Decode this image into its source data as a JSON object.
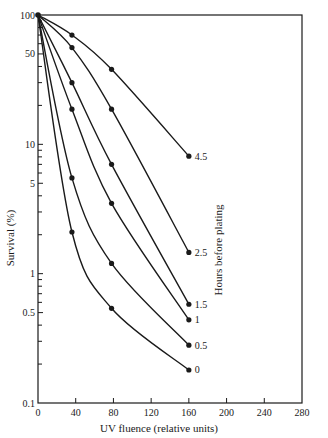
{
  "chart_data": {
    "type": "line",
    "title": "",
    "xlabel": "UV fluence (relative units)",
    "ylabel": "Survival (%)",
    "legend_title": "Hours before plating",
    "legend_position": "right, inline labels at curve ends",
    "x_scale": "linear",
    "y_scale": "log",
    "xlim": [
      0,
      280
    ],
    "ylim": [
      0.1,
      100
    ],
    "x_ticks": [
      0,
      40,
      80,
      120,
      160,
      200,
      240,
      280
    ],
    "x_tick_labels": [
      "0",
      "40",
      "80",
      "120",
      "160",
      "200",
      "240",
      "280"
    ],
    "y_ticks": [
      0.1,
      0.5,
      1,
      5,
      10,
      50,
      100
    ],
    "y_tick_labels": [
      "0.1",
      "0.5",
      "1",
      "5",
      "10",
      "50",
      "100"
    ],
    "grid": false,
    "series": [
      {
        "name": "4.5",
        "x": [
          0,
          36,
          78,
          160
        ],
        "values": [
          100,
          70,
          38,
          8.1
        ]
      },
      {
        "name": "2.5",
        "x": [
          0,
          36,
          78,
          160
        ],
        "values": [
          100,
          56,
          18.7,
          1.46
        ]
      },
      {
        "name": "1.5",
        "x": [
          0,
          36,
          78,
          160
        ],
        "values": [
          100,
          30,
          7,
          0.58
        ]
      },
      {
        "name": "1",
        "x": [
          0,
          36,
          78,
          160
        ],
        "values": [
          100,
          18.7,
          3.5,
          0.44
        ]
      },
      {
        "name": "0.5",
        "x": [
          0,
          36,
          78,
          160
        ],
        "values": [
          100,
          5.5,
          1.2,
          0.28
        ]
      },
      {
        "name": "0",
        "x": [
          0,
          36,
          78,
          160
        ],
        "values": [
          100,
          2.1,
          0.54,
          0.18
        ]
      }
    ]
  },
  "colors": {
    "ink": "#1a1a1a",
    "background": "#ffffff"
  }
}
